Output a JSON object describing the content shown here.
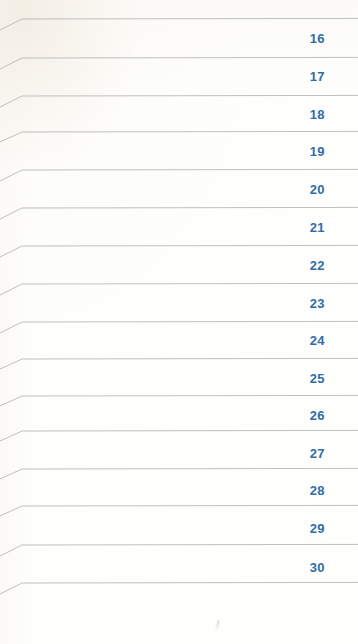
{
  "page": {
    "kind": "scanned-ruled-ledger-page",
    "width": 358,
    "height": 644,
    "background_color": "#fefefc",
    "rule_color": "#b8b8b8",
    "number_color": "#2e6da8"
  },
  "rules": [
    {
      "y": 19,
      "bend_x": 22,
      "left_y_offset": 11
    },
    {
      "y": 58,
      "bend_x": 22,
      "left_y_offset": 11
    },
    {
      "y": 96,
      "bend_x": 22,
      "left_y_offset": 11
    },
    {
      "y": 132,
      "bend_x": 22,
      "left_y_offset": 10
    },
    {
      "y": 170,
      "bend_x": 22,
      "left_y_offset": 11
    },
    {
      "y": 208,
      "bend_x": 22,
      "left_y_offset": 11
    },
    {
      "y": 246,
      "bend_x": 22,
      "left_y_offset": 11
    },
    {
      "y": 284,
      "bend_x": 22,
      "left_y_offset": 11
    },
    {
      "y": 322,
      "bend_x": 22,
      "left_y_offset": 11
    },
    {
      "y": 359,
      "bend_x": 22,
      "left_y_offset": 10
    },
    {
      "y": 396,
      "bend_x": 22,
      "left_y_offset": 10
    },
    {
      "y": 431,
      "bend_x": 22,
      "left_y_offset": 10
    },
    {
      "y": 469,
      "bend_x": 22,
      "left_y_offset": 10
    },
    {
      "y": 506,
      "bend_x": 22,
      "left_y_offset": 10
    },
    {
      "y": 545,
      "bend_x": 22,
      "left_y_offset": 11
    },
    {
      "y": 583,
      "bend_x": 22,
      "left_y_offset": 11
    }
  ],
  "row_numbers": [
    {
      "label": "16",
      "x": 285,
      "y": 31
    },
    {
      "label": "17",
      "x": 285,
      "y": 69
    },
    {
      "label": "18",
      "x": 285,
      "y": 107
    },
    {
      "label": "19",
      "x": 285,
      "y": 144
    },
    {
      "label": "20",
      "x": 285,
      "y": 182
    },
    {
      "label": "21",
      "x": 285,
      "y": 220
    },
    {
      "label": "22",
      "x": 285,
      "y": 258
    },
    {
      "label": "23",
      "x": 285,
      "y": 296
    },
    {
      "label": "24",
      "x": 285,
      "y": 333
    },
    {
      "label": "25",
      "x": 285,
      "y": 371
    },
    {
      "label": "26",
      "x": 285,
      "y": 408
    },
    {
      "label": "27",
      "x": 285,
      "y": 446
    },
    {
      "label": "28",
      "x": 285,
      "y": 483
    },
    {
      "label": "29",
      "x": 285,
      "y": 521
    },
    {
      "label": "30",
      "x": 285,
      "y": 560
    }
  ],
  "artifacts": {
    "scan_speck": {
      "x": 216,
      "y": 620
    }
  }
}
